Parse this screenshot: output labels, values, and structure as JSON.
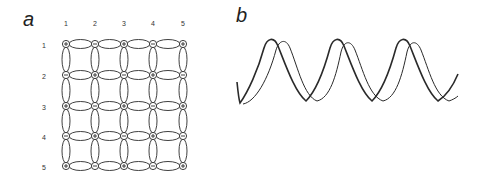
{
  "panels": {
    "a": {
      "label": "a",
      "column_labels": [
        "1",
        "2",
        "3",
        "4",
        "5"
      ],
      "row_labels": [
        "1",
        "2",
        "3",
        "4",
        "5"
      ],
      "node_signs": [
        [
          "+",
          "−",
          "+",
          "−",
          "+"
        ],
        [
          "−",
          "+",
          "−",
          "+",
          "−"
        ],
        [
          "+",
          "−",
          "+",
          "−",
          "+"
        ],
        [
          "−",
          "+",
          "−",
          "+",
          "−"
        ],
        [
          "+",
          "−",
          "+",
          "−",
          "+"
        ]
      ],
      "description": "5×5 lattice of charged nodes connected by elliptical bonds"
    },
    "b": {
      "label": "b",
      "description": "Two phase-shifted periodic waveforms, three peaks each"
    }
  },
  "colors": {
    "line": "#2a2a2a",
    "text": "#222222",
    "background": "#ffffff"
  }
}
